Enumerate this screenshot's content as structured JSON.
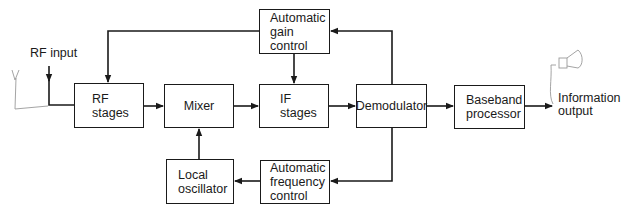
{
  "diagram": {
    "input_label": "RF input",
    "output_label": "Information\noutput",
    "blocks": [
      {
        "id": "rf",
        "label": "RF\nstages"
      },
      {
        "id": "mixer",
        "label": "Mixer"
      },
      {
        "id": "lo",
        "label": "Local\noscillator"
      },
      {
        "id": "agc",
        "label": "Automatic\ngain\ncontrol"
      },
      {
        "id": "if",
        "label": "IF\nstages"
      },
      {
        "id": "demod",
        "label": "Demodulator"
      },
      {
        "id": "afc",
        "label": "Automatic\nfrequency\ncontrol"
      },
      {
        "id": "baseband",
        "label": "Baseband\nprocessor"
      }
    ],
    "connections": [
      {
        "from": "RF input",
        "to": "rf"
      },
      {
        "from": "rf",
        "to": "mixer"
      },
      {
        "from": "lo",
        "to": "mixer"
      },
      {
        "from": "mixer",
        "to": "if"
      },
      {
        "from": "if",
        "to": "demod"
      },
      {
        "from": "demod",
        "to": "baseband"
      },
      {
        "from": "baseband",
        "to": "Information output"
      },
      {
        "from": "demod",
        "to": "agc"
      },
      {
        "from": "agc",
        "to": "if"
      },
      {
        "from": "agc",
        "to": "rf"
      },
      {
        "from": "demod",
        "to": "afc"
      },
      {
        "from": "afc",
        "to": "lo"
      }
    ],
    "sketches": [
      "antenna-icon",
      "speaker-icon"
    ]
  }
}
